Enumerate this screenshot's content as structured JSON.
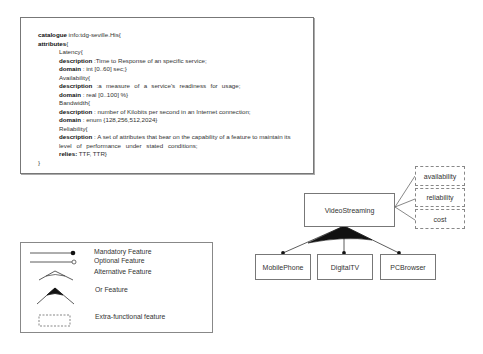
{
  "catalogue": {
    "lines": [
      {
        "indent": 0,
        "key": "catalogue",
        "text": " info:tdg-seville.His{"
      },
      {
        "indent": 0,
        "key": "attributes",
        "text": "{"
      },
      {
        "indent": 1,
        "key": "",
        "text": "Latency{"
      },
      {
        "indent": 1,
        "key": "description",
        "text": " :Time to Response of an specific service;"
      },
      {
        "indent": 1,
        "key": "domain",
        "text": " : int [0..60] sec;}"
      },
      {
        "indent": 1,
        "key": "",
        "text": "Availability{"
      },
      {
        "indent": 1,
        "key": "description",
        "text": " :a measure of a service's readiness for usage;"
      },
      {
        "indent": 1,
        "key": "domain",
        "text": " : real [0..100] %}"
      },
      {
        "indent": 1,
        "key": "",
        "text": "Bandwidth{"
      },
      {
        "indent": 1,
        "key": "description",
        "text": " : number of Kilobits per second in an Internet connection;"
      },
      {
        "indent": 1,
        "key": "domain",
        "text": " : enum {128,256,512,2024}"
      },
      {
        "indent": 1,
        "key": "",
        "text": "Reliability{"
      },
      {
        "indent": 1,
        "key": "description",
        "text": " : A set of attributes that bear on the capability of a feature  to maintain its"
      },
      {
        "indent": 1,
        "key": "",
        "text": "level of performance under stated conditions;"
      },
      {
        "indent": 1,
        "key": "relies:",
        "text": " TTF, TTR}"
      },
      {
        "indent": 0,
        "key": "",
        "text": "}"
      }
    ]
  },
  "legend": {
    "items": [
      {
        "label": "Mandatory Feature",
        "symbol": "mandatory-line-icon"
      },
      {
        "label": "Optional Feature",
        "symbol": "optional-line-icon"
      },
      {
        "label": "Alternative Feature",
        "symbol": "alternative-arc-icon"
      },
      {
        "label": "Or Feature",
        "symbol": "or-filled-arc-icon"
      },
      {
        "label": "Extra-functional feature",
        "symbol": "dashed-box-icon"
      }
    ]
  },
  "feature_model": {
    "root": "VideoStreaming",
    "children": [
      "MobilePhone",
      "DigitalTV",
      "PCBrowser"
    ],
    "relation": "or",
    "extra_functional": [
      "availability",
      "reliability",
      "cost"
    ]
  }
}
